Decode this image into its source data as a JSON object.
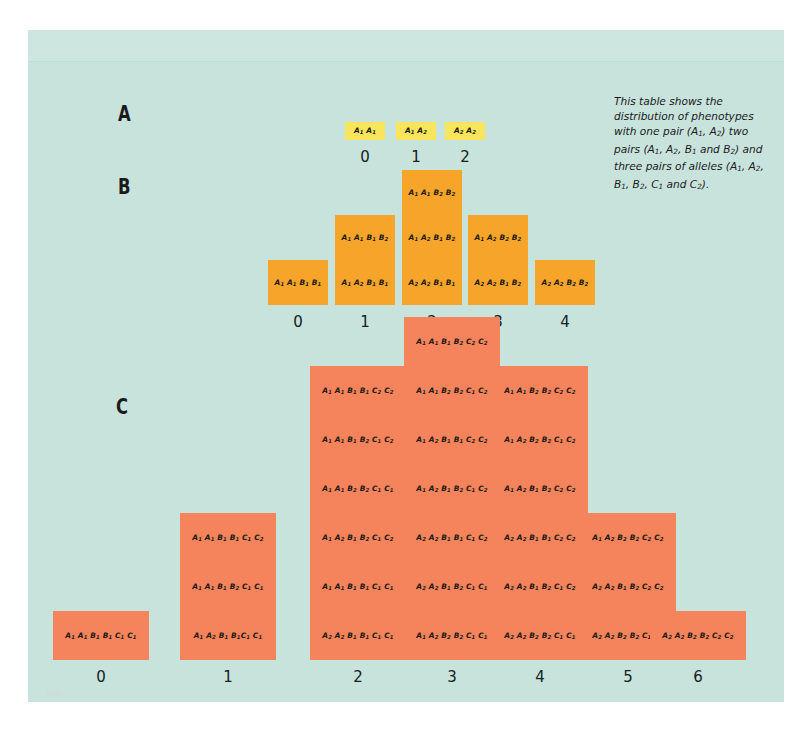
{
  "figure": {
    "background_color": "#c8e2dc",
    "caption": "This table shows the distribution of phenotypes with one pair (A1, A2) two pairs (A1, A2, B1 and B2) and three pairs of alleles (A1, A2, B1, B2, C1 and C2).",
    "corner_mark": "129"
  },
  "sections": {
    "a_label": "A",
    "b_label": "B",
    "c_label": "C"
  },
  "chart_data": [
    {
      "type": "bar",
      "id": "A",
      "title": "A",
      "color": "#f9e55c",
      "categories": [
        "0",
        "1",
        "2"
      ],
      "values": [
        1,
        1,
        1
      ],
      "xlabel": "",
      "ylabel": "",
      "cells": [
        [
          "A1 A1"
        ],
        [
          "A1 A2"
        ],
        [
          "A2 A2"
        ]
      ]
    },
    {
      "type": "bar",
      "id": "B",
      "title": "B",
      "color": "#f7a42b",
      "categories": [
        "0",
        "1",
        "2",
        "3",
        "4"
      ],
      "values": [
        1,
        2,
        3,
        2,
        1
      ],
      "xlabel": "",
      "ylabel": "",
      "cells": [
        [
          "A1 A1 B1 B1"
        ],
        [
          "A1 A1 B1 B2",
          "A1 A2 B1 B1"
        ],
        [
          "A1 A1 B2 B2",
          "A1 A2 B1 B2",
          "A2 A2 B1 B1"
        ],
        [
          "A1 A2 B2 B2",
          "A2 A2 B1 B2"
        ],
        [
          "A2 A2 B2 B2"
        ]
      ]
    },
    {
      "type": "bar",
      "id": "C",
      "title": "C",
      "color": "#f5845c",
      "categories": [
        "0",
        "1",
        "2",
        "3",
        "4",
        "5",
        "6"
      ],
      "values": [
        1,
        3,
        6,
        7,
        6,
        3,
        1
      ],
      "xlabel": "",
      "ylabel": "",
      "cells": [
        [
          "A1 A1 B1 B1 C1 C1"
        ],
        [
          "A1 A1 B1 B1 C1 C2",
          "A1 A1 B1 B2 C1 C1",
          "A1 A2 B1 B1C1 C1"
        ],
        [
          "A1 A1 B1 B1 C2 C2",
          "A1 A1 B1 B2 C1 C2",
          "A1 A1 B2 B2 C1 C1",
          "A1 A2 B1 B2 C1 C2",
          "A1 A1 B1 B1 C1 C1",
          "A2 A2 B1 B1 C1 C1"
        ],
        [
          "A1 A1 B1 B2 C2 C2",
          "A1 A1 B2 B2 C1 C2",
          "A1 A2 B1 B1 C2 C2",
          "A1 A2 B1 B2 C1 C2",
          "A2 A2 B1 B1 C1 C2",
          "A2 A2 B1 B2 C1 C1",
          "A1 A2 B2 B2 C1 C1"
        ],
        [
          "A1 A1 B2 B2 C2 C2",
          "A1 A2 B2 B2 C1 C2",
          "A1 A2 B1 B2 C2 C2",
          "A2 A2 B1 B1 C2 C2",
          "A2 A2 B1 B2 C1 C2",
          "A2 A2 B2 B2 C1 C1"
        ],
        [
          "A1 A2 B2 B2 C2 C2",
          "A2 A2 B1 B2 C2 C2",
          "A2 A2 B2 B2 C1 C2"
        ],
        [
          "A2 A2 B2 B2 C2 C2"
        ]
      ]
    }
  ]
}
